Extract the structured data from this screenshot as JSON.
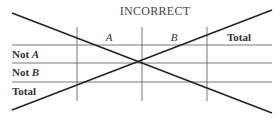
{
  "title": "INCORRECT",
  "table": {
    "column_headers": [
      {
        "label": "A",
        "italic": true
      },
      {
        "label": "B",
        "italic": true
      },
      {
        "label": "Total",
        "italic": false
      }
    ],
    "row_headers": [
      {
        "prefix": "Not ",
        "var": "A"
      },
      {
        "prefix": "Not ",
        "var": "B"
      },
      {
        "prefix": "Total",
        "var": ""
      }
    ]
  },
  "cross_out": {
    "description": "Two diagonal lines crossing out the table",
    "color": "#222222"
  }
}
